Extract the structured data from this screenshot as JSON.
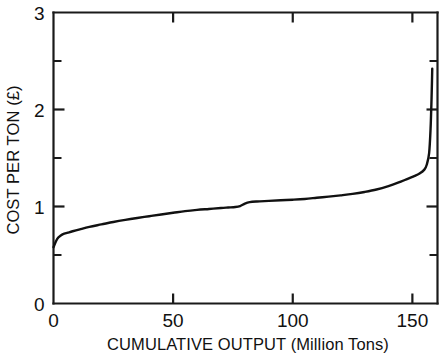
{
  "chart_data": {
    "type": "line",
    "title": "",
    "xlabel": "CUMULATIVE OUTPUT (Million Tons)",
    "ylabel": "COST PER TON (£)",
    "xlim": [
      0,
      160.5
    ],
    "ylim": [
      0,
      3
    ],
    "grid": false,
    "legend": null,
    "x_ticks_major": [
      0,
      50,
      100,
      150
    ],
    "x_tick_labels": [
      "0",
      "50",
      "100",
      "150"
    ],
    "y_ticks_major": [
      0,
      1,
      2,
      3
    ],
    "y_tick_labels": [
      "0",
      "1",
      "2",
      "3"
    ],
    "y_ticks_minor": [
      0.5,
      1.5,
      2.5
    ],
    "series": [
      {
        "name": "cost per ton",
        "x": [
          0,
          1,
          2,
          3,
          4,
          6,
          8,
          11,
          15,
          20,
          25,
          30,
          35,
          40,
          45,
          50,
          55,
          60,
          65,
          70,
          73,
          76,
          78,
          80,
          82,
          85,
          90,
          95,
          100,
          105,
          110,
          115,
          120,
          125,
          130,
          135,
          140,
          144,
          148,
          151,
          153,
          155,
          156,
          157,
          157.6,
          158,
          158.2,
          158.3
        ],
        "y": [
          0.58,
          0.64,
          0.68,
          0.7,
          0.715,
          0.73,
          0.745,
          0.765,
          0.79,
          0.815,
          0.84,
          0.862,
          0.882,
          0.9,
          0.918,
          0.935,
          0.952,
          0.965,
          0.975,
          0.985,
          0.99,
          0.995,
          1.005,
          1.03,
          1.045,
          1.052,
          1.058,
          1.064,
          1.07,
          1.078,
          1.09,
          1.102,
          1.115,
          1.13,
          1.15,
          1.175,
          1.21,
          1.245,
          1.285,
          1.315,
          1.34,
          1.38,
          1.43,
          1.55,
          1.8,
          2.1,
          2.3,
          2.42
        ]
      }
    ]
  },
  "axis": {
    "y_title": "COST PER TON (£)",
    "x_title": "CUMULATIVE OUTPUT (Million Tons)"
  },
  "colors": {
    "curve": "#111111",
    "axis": "#1a1a1a",
    "background": "#ffffff"
  }
}
